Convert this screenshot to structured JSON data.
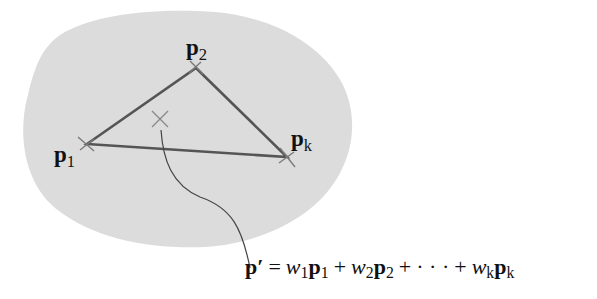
{
  "diagram": {
    "type": "convex-combination-illustration",
    "colors": {
      "region_fill": "#dcdcdc",
      "triangle_stroke": "#555555",
      "marker_stroke": "#7a7a7a",
      "leader_stroke": "#444444",
      "text": "#111111",
      "background": "#ffffff"
    },
    "points": [
      {
        "id": "p1",
        "symbol": "p",
        "subscript": "1",
        "x": 87,
        "y": 144
      },
      {
        "id": "p2",
        "symbol": "p",
        "subscript": "2",
        "x": 196,
        "y": 68
      },
      {
        "id": "pk",
        "symbol": "p",
        "subscript": "k",
        "x": 287,
        "y": 157
      }
    ],
    "interior_point": {
      "id": "p_prime",
      "x": 160,
      "y": 120
    },
    "formula": {
      "lhs_symbol": "p",
      "lhs_prime": "′",
      "equals": "=",
      "terms": [
        {
          "weight": "w",
          "weight_sub": "1",
          "point": "p",
          "point_sub": "1"
        },
        {
          "weight": "w",
          "weight_sub": "2",
          "point": "p",
          "point_sub": "2"
        },
        {
          "weight": "w",
          "weight_sub": "k",
          "point": "p",
          "point_sub": "k"
        }
      ],
      "plus": "+",
      "ellipsis": "· · ·"
    }
  }
}
